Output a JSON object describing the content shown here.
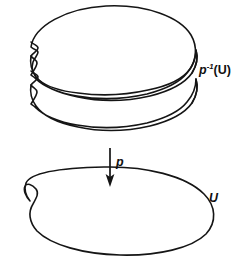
{
  "figure": {
    "kind": "covering-space-diagram",
    "background_color": "#ffffff",
    "line_color": "#151515",
    "width": 245,
    "height": 266
  },
  "labels": {
    "preimage": {
      "text": "p⁻¹(U)",
      "base": "p",
      "exponent": "-1",
      "argument": "(U)",
      "meaning": "preimage-of-U-under-p"
    },
    "projection": {
      "text": "p",
      "meaning": "covering-projection-map"
    },
    "base": {
      "text": "U",
      "meaning": "open-set-U-in-base-space"
    }
  },
  "shapes": {
    "sheets": [
      {
        "name": "sheet-top",
        "order": 1
      },
      {
        "name": "sheet-middle",
        "order": 2
      },
      {
        "name": "sheet-bottom",
        "order": 3
      }
    ],
    "base_blob": {
      "name": "base-open-set-U"
    },
    "arrow": {
      "name": "projection-arrow",
      "direction": "down"
    }
  }
}
